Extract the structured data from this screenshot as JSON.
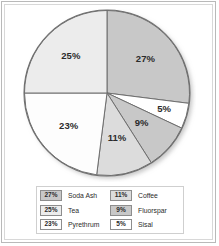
{
  "chart_data": {
    "type": "pie",
    "title": "",
    "labels": [
      "Soda Ash",
      "Sisal",
      "Fluorspar",
      "Coffee",
      "Pyrethrum",
      "Tea"
    ],
    "values": [
      27,
      5,
      9,
      11,
      23,
      25
    ],
    "value_labels": [
      "27%",
      "5%",
      "9%",
      "11%",
      "23%",
      "25%"
    ],
    "colors": [
      "#c8c8c8",
      "#ffffff",
      "#c8c8c8",
      "#dcdcdc",
      "#fdfdfd",
      "#ececec"
    ],
    "start_angle_deg": 0,
    "direction": "clockwise",
    "legend_position": "bottom",
    "grid": false
  },
  "pie": {
    "slices": [
      {
        "label": "Soda Ash",
        "value": 27,
        "text": "27%",
        "color": "#c8c8c8"
      },
      {
        "label": "Sisal",
        "value": 5,
        "text": "5%",
        "color": "#ffffff"
      },
      {
        "label": "Fluorspar",
        "value": 9,
        "text": "9%",
        "color": "#c8c8c8"
      },
      {
        "label": "Coffee",
        "value": 11,
        "text": "11%",
        "color": "#dcdcdc"
      },
      {
        "label": "Pyrethrum",
        "value": 23,
        "text": "23%",
        "color": "#fdfdfd"
      },
      {
        "label": "Tea",
        "value": 25,
        "text": "25%",
        "color": "#ececec"
      }
    ]
  },
  "legend": {
    "left_column": [
      {
        "value": "27%",
        "label": "Soda Ash",
        "color": "#c8c8c8"
      },
      {
        "value": "25%",
        "label": "Tea",
        "color": "#ececec"
      },
      {
        "value": "23%",
        "label": "Pyrethrum",
        "color": "#fdfdfd"
      }
    ],
    "right_column": [
      {
        "value": "11%",
        "label": "Coffee",
        "color": "#dcdcdc"
      },
      {
        "value": "9%",
        "label": "Fluorspar",
        "color": "#c8c8c8"
      },
      {
        "value": "5%",
        "label": "Sisal",
        "color": "#ffffff"
      }
    ]
  },
  "style": {
    "outline_color": "#6f6f6f",
    "frame_color": "#b9b9b9",
    "label_color": "#2b2b2b"
  }
}
